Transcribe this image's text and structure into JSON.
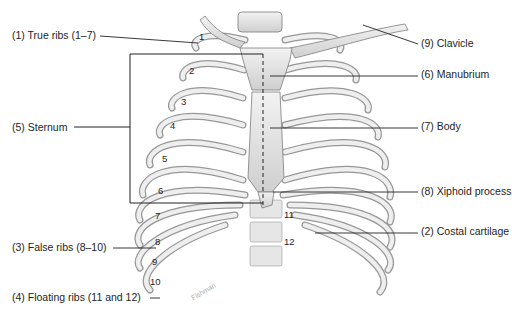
{
  "diagram": {
    "labels": [
      {
        "id": "true-ribs",
        "text": "(1) True ribs (1–7)",
        "x": 12,
        "y": 30,
        "side": "left"
      },
      {
        "id": "sternum",
        "text": "(5) Sternum",
        "x": 12,
        "y": 123,
        "side": "left"
      },
      {
        "id": "false-ribs",
        "text": "(3) False ribs (8–10)",
        "x": 12,
        "y": 241,
        "side": "left"
      },
      {
        "id": "floating-ribs",
        "text": "(4) Floating ribs (11 and 12)",
        "x": 12,
        "y": 292,
        "side": "left"
      },
      {
        "id": "clavicle",
        "text": "(9) Clavicle",
        "x": 421,
        "y": 38,
        "side": "right"
      },
      {
        "id": "manubrium",
        "text": "(6) Manubrium",
        "x": 421,
        "y": 68,
        "side": "right"
      },
      {
        "id": "body",
        "text": "(7) Body",
        "x": 421,
        "y": 120,
        "side": "right"
      },
      {
        "id": "xiphoid",
        "text": "(8) Xiphoid process",
        "x": 421,
        "y": 186,
        "side": "right"
      },
      {
        "id": "costal-cartilage",
        "text": "(2) Costal cartilage",
        "x": 421,
        "y": 226,
        "side": "right"
      }
    ],
    "rib_numbers": [
      {
        "text": "1",
        "x": 199,
        "y": 33
      },
      {
        "text": "2",
        "x": 189,
        "y": 66
      },
      {
        "text": "3",
        "x": 181,
        "y": 98
      },
      {
        "text": "4",
        "x": 170,
        "y": 122
      },
      {
        "text": "5",
        "x": 162,
        "y": 155
      },
      {
        "text": "6",
        "x": 158,
        "y": 187
      },
      {
        "text": "7",
        "x": 155,
        "y": 212
      },
      {
        "text": "8",
        "x": 155,
        "y": 237
      },
      {
        "text": "9",
        "x": 152,
        "y": 258
      },
      {
        "text": "10",
        "x": 150,
        "y": 278
      },
      {
        "text": "11",
        "x": 282,
        "y": 210
      },
      {
        "text": "12",
        "x": 282,
        "y": 237
      }
    ],
    "signature": "Fishman"
  }
}
